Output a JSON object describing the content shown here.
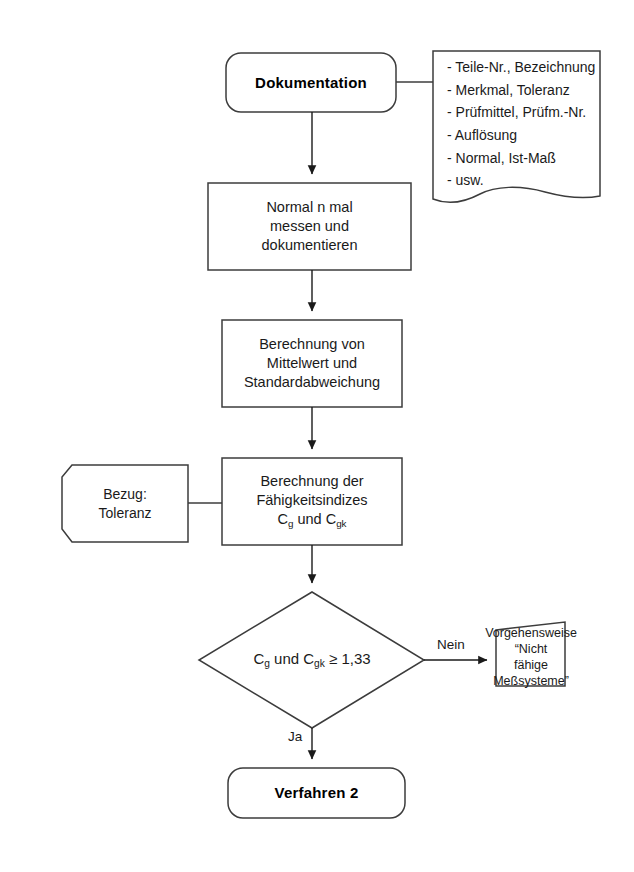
{
  "diagram": {
    "stroke_color": "#3c3c3c",
    "text_color": "#1a1a1a",
    "background": "#ffffff"
  },
  "nodes": {
    "start": {
      "shape": "terminal-rounded",
      "label": "Dokumentation"
    },
    "doc_note": {
      "shape": "document",
      "items": [
        "- Teile-Nr., Bezeichnung",
        "- Merkmal, Toleranz",
        "- Prüfmittel, Prüfm.-Nr.",
        "- Auflösung",
        "- Normal, Ist-Maß",
        "- usw."
      ]
    },
    "measure": {
      "shape": "process",
      "lines": [
        "Normal n mal",
        "messen und",
        "dokumentieren"
      ]
    },
    "calc_stats": {
      "shape": "process",
      "lines": [
        "Berechnung von",
        "Mittelwert und",
        "Standardabweichung"
      ]
    },
    "calc_indices": {
      "shape": "process",
      "line1": "Berechnung der",
      "line2": "Fähigkeitsindizes",
      "line3_prefix": "C",
      "line3_sub1": "g",
      "line3_mid": " und C",
      "line3_sub2": "gk"
    },
    "reference": {
      "shape": "reference-hexagon",
      "lines": [
        "Bezug:",
        "Toleranz"
      ]
    },
    "decision": {
      "shape": "diamond",
      "prefix": "C",
      "sub1": "g",
      "mid": " und C",
      "sub2": "gk",
      "suffix": " ≥ 1,33"
    },
    "not_capable": {
      "shape": "process-skewed",
      "lines": [
        "Vorgehensweise",
        "“Nicht fähige",
        "Meßsysteme”"
      ]
    },
    "end": {
      "shape": "terminal-rounded",
      "label": "Verfahren 2"
    }
  },
  "edges": {
    "no_label": "Nein",
    "yes_label": "Ja"
  }
}
